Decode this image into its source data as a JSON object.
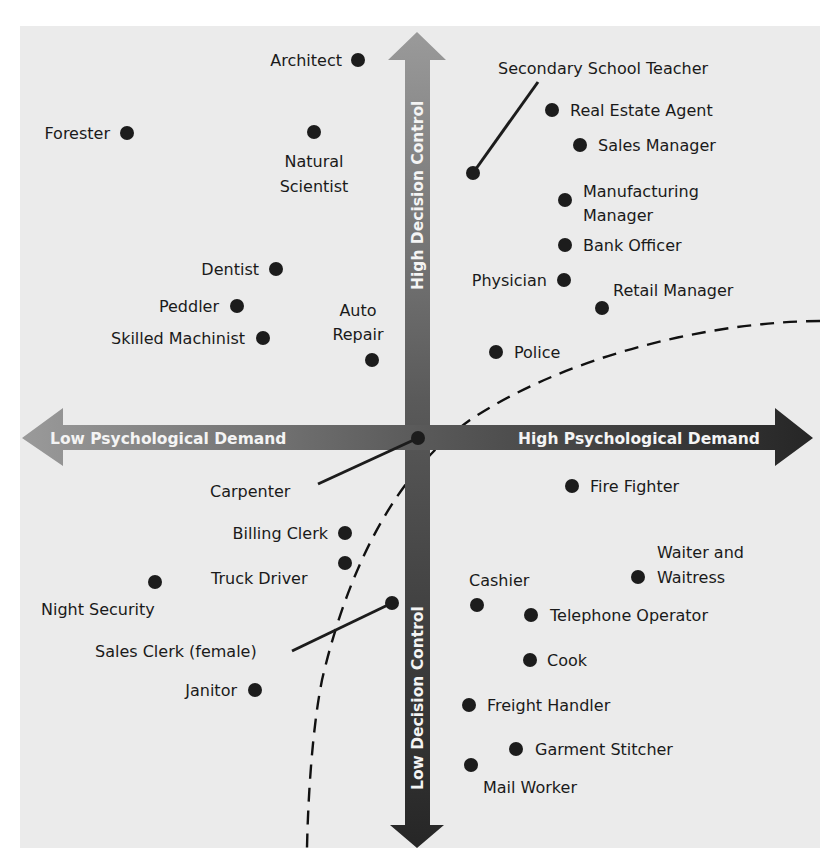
{
  "diagram": {
    "title": "",
    "axes": {
      "vertical_top_label": "High Decision Control",
      "vertical_bottom_label": "Low Decision Control",
      "horizontal_left_label": "Low Psychological Demand",
      "horizontal_right_label": "High Psychological Demand"
    },
    "colors": {
      "panel": "#ebebeb",
      "axis_light": "#8a8a8a",
      "axis_dark": "#2a2a2a",
      "dot": "#1c1c1c",
      "label_text": "#1a1a1a",
      "axis_text": "#f4f4f4"
    },
    "occupations": [
      {
        "name": "Architect",
        "label": "Architect",
        "x": 358,
        "y": 60,
        "quadrant": "low demand / high control"
      },
      {
        "name": "Forester",
        "label": "Forester",
        "x": 127,
        "y": 133,
        "quadrant": "low demand / high control"
      },
      {
        "name": "Natural Scientist",
        "label": "Natural Scientist",
        "x": 314,
        "y": 132,
        "quadrant": "low demand / high control"
      },
      {
        "name": "Dentist",
        "label": "Dentist",
        "x": 276,
        "y": 269,
        "quadrant": "low demand / high control"
      },
      {
        "name": "Peddler",
        "label": "Peddler",
        "x": 237,
        "y": 306,
        "quadrant": "low demand / high control"
      },
      {
        "name": "Skilled Machinist",
        "label": "Skilled Machinist",
        "x": 263,
        "y": 338,
        "quadrant": "low demand / high control"
      },
      {
        "name": "Auto Repair",
        "label": "Auto Repair",
        "x": 372,
        "y": 360,
        "quadrant": "low demand / high control"
      },
      {
        "name": "Secondary School Teacher",
        "label": "Secondary School Teacher",
        "x": 473,
        "y": 173,
        "quadrant": "high demand / high control"
      },
      {
        "name": "Real Estate Agent",
        "label": "Real Estate Agent",
        "x": 552,
        "y": 110,
        "quadrant": "high demand / high control"
      },
      {
        "name": "Sales Manager",
        "label": "Sales Manager",
        "x": 580,
        "y": 145,
        "quadrant": "high demand / high control"
      },
      {
        "name": "Manufacturing Manager",
        "label": "Manufacturing Manager",
        "x": 565,
        "y": 200,
        "quadrant": "high demand / high control"
      },
      {
        "name": "Bank Officer",
        "label": "Bank Officer",
        "x": 565,
        "y": 245,
        "quadrant": "high demand / high control"
      },
      {
        "name": "Physician",
        "label": "Physician",
        "x": 564,
        "y": 280,
        "quadrant": "high demand / high control"
      },
      {
        "name": "Retail Manager",
        "label": "Retail Manager",
        "x": 602,
        "y": 308,
        "quadrant": "high demand / high control"
      },
      {
        "name": "Police",
        "label": "Police",
        "x": 496,
        "y": 352,
        "quadrant": "high demand / high control"
      },
      {
        "name": "Carpenter",
        "label": "Carpenter",
        "x": 418,
        "y": 438,
        "quadrant": "center"
      },
      {
        "name": "Billing Clerk",
        "label": "Billing Clerk",
        "x": 345,
        "y": 533,
        "quadrant": "low demand / low control"
      },
      {
        "name": "Truck Driver",
        "label": "Truck Driver",
        "x": 345,
        "y": 563,
        "quadrant": "low demand / low control"
      },
      {
        "name": "Night Security",
        "label": "Night Security",
        "x": 155,
        "y": 582,
        "quadrant": "low demand / low control"
      },
      {
        "name": "Sales Clerk (female)",
        "label": "Sales Clerk (female)",
        "x": 392,
        "y": 603,
        "quadrant": "low demand / low control"
      },
      {
        "name": "Janitor",
        "label": "Janitor",
        "x": 255,
        "y": 690,
        "quadrant": "low demand / low control"
      },
      {
        "name": "Fire Fighter",
        "label": "Fire Fighter",
        "x": 572,
        "y": 486,
        "quadrant": "high demand / low control"
      },
      {
        "name": "Waiter and Waitress",
        "label": "Waiter and Waitress",
        "x": 638,
        "y": 577,
        "quadrant": "high demand / low control"
      },
      {
        "name": "Cashier",
        "label": "Cashier",
        "x": 477,
        "y": 605,
        "quadrant": "high demand / low control"
      },
      {
        "name": "Telephone Operator",
        "label": "Telephone Operator",
        "x": 531,
        "y": 615,
        "quadrant": "high demand / low control"
      },
      {
        "name": "Cook",
        "label": "Cook",
        "x": 530,
        "y": 660,
        "quadrant": "high demand / low control"
      },
      {
        "name": "Freight Handler",
        "label": "Freight Handler",
        "x": 469,
        "y": 705,
        "quadrant": "high demand / low control"
      },
      {
        "name": "Garment Stitcher",
        "label": "Garment Stitcher",
        "x": 516,
        "y": 749,
        "quadrant": "high demand / low control"
      },
      {
        "name": "Mail Worker",
        "label": "Mail Worker",
        "x": 471,
        "y": 765,
        "quadrant": "high demand / low control"
      }
    ],
    "labels": {
      "architect": "Architect",
      "forester": "Forester",
      "natural_scientist_1": "Natural",
      "natural_scientist_2": "Scientist",
      "dentist": "Dentist",
      "peddler": "Peddler",
      "skilled_machinist": "Skilled Machinist",
      "auto_repair_1": "Auto",
      "auto_repair_2": "Repair",
      "secondary_school_teacher": "Secondary School Teacher",
      "real_estate_agent": "Real Estate Agent",
      "sales_manager": "Sales Manager",
      "manufacturing_manager_1": "Manufacturing",
      "manufacturing_manager_2": "Manager",
      "bank_officer": "Bank Officer",
      "physician": "Physician",
      "retail_manager": "Retail Manager",
      "police": "Police",
      "carpenter": "Carpenter",
      "billing_clerk": "Billing Clerk",
      "truck_driver": "Truck Driver",
      "night_security": "Night Security",
      "sales_clerk": "Sales Clerk (female)",
      "janitor": "Janitor",
      "fire_fighter": "Fire Fighter",
      "waiter_1": "Waiter and",
      "waiter_2": "Waitress",
      "cashier": "Cashier",
      "telephone_operator": "Telephone Operator",
      "cook": "Cook",
      "freight_handler": "Freight Handler",
      "garment_stitcher": "Garment Stitcher",
      "mail_worker": "Mail Worker"
    },
    "curve": {
      "style": "dashed",
      "description": "boundary curve separating high-strain region (lower right)"
    }
  }
}
